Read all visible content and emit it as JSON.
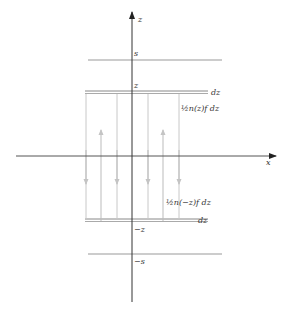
{
  "diagram": {
    "axes": {
      "vertical_label": "z",
      "horizontal_label": "x"
    },
    "levels": {
      "s_label": "s",
      "z_label": "z",
      "neg_z_label": "−z",
      "neg_s_label": "−s",
      "dz_top_label": "dz",
      "dz_bottom_label": "dz"
    },
    "flux_labels": {
      "upper": "½n(z)f dz",
      "lower": "½n(−z)f dz"
    },
    "colors": {
      "axis": "#333333",
      "plane": "#888888",
      "flux_line": "#aaaaaa",
      "arrow": "#bbbbbb",
      "text": "#333333"
    }
  }
}
